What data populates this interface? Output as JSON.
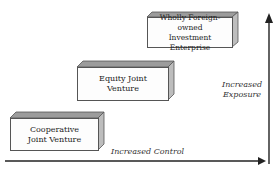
{
  "diagram": {
    "boxes": [
      {
        "line1": "Cooperative",
        "line2": "Joint Venture"
      },
      {
        "line1": "Equity Joint",
        "line2": "Venture"
      },
      {
        "line1": "Wholly Foreign-owned",
        "line2": "Investment Enterprise"
      }
    ],
    "x_axis_label": "Increased Control",
    "y_axis_label_line1": "Increased",
    "y_axis_label_line2": "Exposure",
    "colors": {
      "top_face": "#9a9a9a",
      "side_face": "#b8b8b8",
      "front_face": "#fdfdfd",
      "axis": "#222222"
    }
  }
}
